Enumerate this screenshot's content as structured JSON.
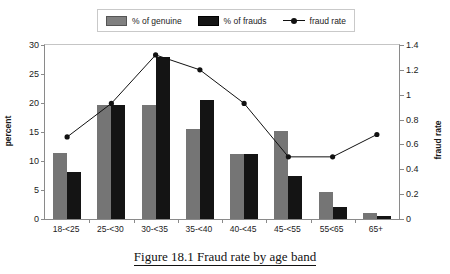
{
  "caption": "Figure 18.1 Fraud rate by age band",
  "legend": {
    "items": [
      {
        "label": "% of genuine",
        "icon": "gray-square-swatch",
        "color": "#808080"
      },
      {
        "label": "% of frauds",
        "icon": "black-square-swatch",
        "color": "#151515"
      },
      {
        "label": "fraud rate",
        "icon": "line-marker-swatch",
        "color": "#111111"
      }
    ]
  },
  "chart_data": {
    "type": "bar",
    "title": "Figure 18.1 Fraud rate by age band",
    "xlabel": "",
    "ylabel": "percent",
    "y2label": "fraud rate",
    "categories": [
      "18-<25",
      "25-<30",
      "30-<35",
      "35-<40",
      "40-<45",
      "45-<55",
      "55<65",
      "65+"
    ],
    "series": [
      {
        "name": "% of genuine",
        "type": "bar",
        "axis": "left",
        "color": "#757575",
        "values": [
          11.3,
          19.6,
          19.7,
          15.6,
          11.2,
          15.2,
          4.6,
          1.0
        ]
      },
      {
        "name": "% of frauds",
        "type": "bar",
        "axis": "left",
        "color": "#141414",
        "values": [
          8.1,
          19.6,
          28.0,
          20.6,
          11.2,
          7.4,
          2.1,
          0.5
        ]
      },
      {
        "name": "fraud rate",
        "type": "line",
        "axis": "right",
        "color": "#111111",
        "values": [
          0.66,
          0.93,
          1.32,
          1.2,
          0.93,
          0.5,
          0.5,
          0.68
        ]
      }
    ],
    "ylim": [
      0,
      30
    ],
    "yticks": [
      0,
      5,
      10,
      15,
      20,
      25,
      30
    ],
    "y2lim": [
      0,
      1.4
    ],
    "y2ticks": [
      "0",
      "0.2",
      "0.4",
      "0.6",
      "0.8",
      "1",
      "1.2",
      "1.4"
    ],
    "y2tickvalues": [
      0,
      0.2,
      0.4,
      0.6,
      0.8,
      1.0,
      1.2,
      1.4
    ],
    "grid": false,
    "legend_position": "top-center"
  }
}
